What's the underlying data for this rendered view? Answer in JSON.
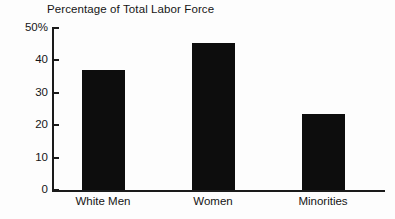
{
  "chart_data": {
    "type": "bar",
    "title": "Percentage of Total Labor Force",
    "xlabel": "",
    "ylabel": "",
    "categories": [
      "White Men",
      "Women",
      "Minorities"
    ],
    "values": [
      37,
      45.5,
      23.5
    ],
    "ylim": [
      0,
      50
    ],
    "yticks": [
      {
        "value": 50,
        "label": "50%"
      },
      {
        "value": 40,
        "label": "40"
      },
      {
        "value": 30,
        "label": "30"
      },
      {
        "value": 20,
        "label": "20"
      },
      {
        "value": 10,
        "label": "10"
      },
      {
        "value": 0,
        "label": "0"
      }
    ],
    "grid": false,
    "legend": false,
    "bar_color": "#0d0d0d",
    "axis_color": "#1a1a1a",
    "background_color": "#fdfdfd"
  }
}
